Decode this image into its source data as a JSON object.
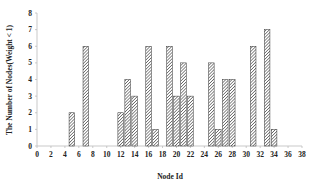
{
  "chart_data": {
    "type": "bar",
    "title": "",
    "xlabel": "Node Id",
    "ylabel": "The Number of Nodes(Weight < 1)",
    "xlim": [
      0,
      38
    ],
    "ylim": [
      0,
      8
    ],
    "xticks": [
      0,
      2,
      4,
      6,
      8,
      10,
      12,
      14,
      16,
      18,
      20,
      22,
      24,
      26,
      28,
      30,
      32,
      34,
      36,
      38
    ],
    "yticks": [
      0,
      1,
      2,
      3,
      4,
      5,
      6,
      7,
      8
    ],
    "grid": false,
    "legend": null,
    "bar_style": "diagonal-hatch",
    "colors": {
      "bar_fill": "#ffffff",
      "hatch": "#333333",
      "bar_edge": "#333333",
      "axis": "#bbbbbb"
    },
    "x": [
      5,
      7,
      12,
      13,
      14,
      16,
      17,
      19,
      20,
      21,
      22,
      25,
      26,
      27,
      28,
      31,
      33,
      34
    ],
    "values": [
      2,
      6,
      2,
      4,
      3,
      6,
      1,
      6,
      3,
      5,
      3,
      5,
      1,
      4,
      4,
      6,
      7,
      1
    ]
  }
}
